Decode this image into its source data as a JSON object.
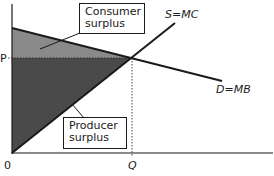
{
  "diagram": {
    "type": "supply-demand-surplus",
    "colors": {
      "consumer_surplus_fill": "#8a8a8a",
      "producer_surplus_fill": "#4a4a4a",
      "line": "#1a1a1a",
      "background": "#ffffff"
    },
    "axes": {
      "origin_label": "0",
      "price_label": "P",
      "quantity_label": "Q"
    },
    "curves": {
      "supply_label": "S=MC",
      "demand_label": "D=MB"
    },
    "callouts": {
      "consumer_surplus_line1": "Consumer",
      "consumer_surplus_line2": "surplus",
      "producer_surplus_line1": "Producer",
      "producer_surplus_line2": "surplus"
    }
  }
}
